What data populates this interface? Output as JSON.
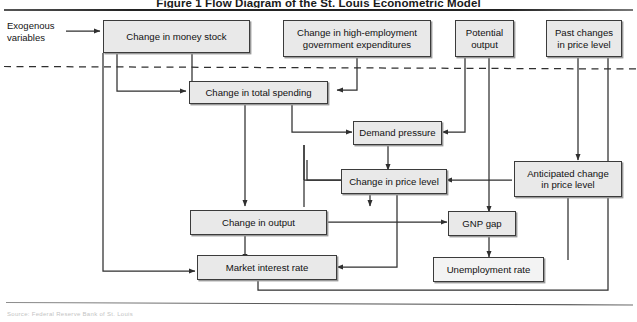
{
  "figure": {
    "title": "Figure 1  Flow Diagram of the St. Louis Econometric Model",
    "caption": "Source: Federal Reserve Bank of St. Louis",
    "exogenous_label": "Exogenous\nvariables",
    "exogenous_label_line1": "Exogenous",
    "exogenous_label_line2": "variables",
    "colors": {
      "node_fill": "#e9e9e9",
      "node_border": "#3b3b3b",
      "node_shadow": "#9a9a9a",
      "connector": "#2f2f2f",
      "divider_dashed": "#2f2f2f",
      "background": "#ffffff"
    }
  },
  "nodes": [
    {
      "id": "money-stock",
      "label": "Change in money stock",
      "line1": "Change in money stock",
      "line2": ""
    },
    {
      "id": "gov-expenditures",
      "label": "Change in high-employment government expenditures",
      "line1": "Change in high-employment",
      "line2": "government expenditures"
    },
    {
      "id": "potential-output",
      "label": "Potential output",
      "line1": "Potential",
      "line2": "output"
    },
    {
      "id": "past-price-changes",
      "label": "Past changes in price level",
      "line1": "Past changes",
      "line2": "in price level"
    },
    {
      "id": "total-spending",
      "label": "Change in total spending",
      "line1": "Change in total spending",
      "line2": ""
    },
    {
      "id": "demand-pressure",
      "label": "Demand pressure",
      "line1": "Demand pressure",
      "line2": ""
    },
    {
      "id": "price-level-change",
      "label": "Change in price level",
      "line1": "Change in price level",
      "line2": ""
    },
    {
      "id": "anticipated-price",
      "label": "Anticipated change in price level",
      "line1": "Anticipated change",
      "line2": "in price level"
    },
    {
      "id": "output-change",
      "label": "Change in output",
      "line1": "Change in output",
      "line2": ""
    },
    {
      "id": "gnp-gap",
      "label": "GNP gap",
      "line1": "GNP gap",
      "line2": ""
    },
    {
      "id": "market-interest-rate",
      "label": "Market interest rate",
      "line1": "Market interest rate",
      "line2": ""
    },
    {
      "id": "unemployment-rate",
      "label": "Unemployment rate",
      "line1": "Unemployment rate",
      "line2": ""
    }
  ]
}
